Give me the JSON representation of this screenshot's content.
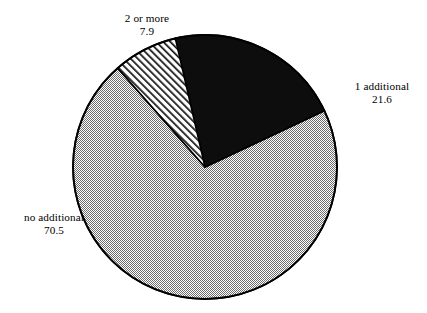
{
  "figure": {
    "background_color": "#ffffff",
    "width": 427,
    "height": 313
  },
  "chart_data": {
    "type": "pie",
    "title": "",
    "subtitle": "",
    "xlabel": "",
    "ylabel": "",
    "legend_position": "none",
    "grid": false,
    "units": "percent",
    "total": 100.0,
    "start_angle_deg_from_12oclock": -13,
    "direction": "clockwise",
    "categories": [
      "1 additional",
      "no additional",
      "2 or more"
    ],
    "values": [
      21.6,
      70.5,
      7.9
    ],
    "labels": [
      {
        "name": "1 additional",
        "value": "21.6",
        "value_number": 21.6,
        "fill": "black-solid",
        "color": "#0a0a0a",
        "position": "right"
      },
      {
        "name": "no additional",
        "value": "70.5",
        "value_number": 70.5,
        "fill": "gray-dither",
        "color": "#b5b5b5",
        "position": "left"
      },
      {
        "name": "2 or more",
        "value": "7.9",
        "value_number": 7.9,
        "fill": "diagonal-hatch",
        "color": "#ffffff",
        "position": "top"
      }
    ],
    "slices": [
      {
        "label": "1 additional",
        "percent": 21.6,
        "sweep_deg": 77.76,
        "start_deg": -13.0,
        "end_deg": 64.76
      },
      {
        "label": "no additional",
        "percent": 70.5,
        "sweep_deg": 253.8,
        "start_deg": 64.76,
        "end_deg": 318.56
      },
      {
        "label": "2 or more",
        "percent": 7.9,
        "sweep_deg": 28.44,
        "start_deg": 318.56,
        "end_deg": 347.0
      }
    ],
    "geometry": {
      "center_x": 205,
      "center_y": 167,
      "radius": 132,
      "outline_color": "#000000",
      "outline_width": 1.6
    }
  },
  "labels_text": {
    "two_or_more": {
      "name": "2 or more",
      "value": "7.9"
    },
    "one_additional": {
      "name": "1 additional",
      "value": "21.6"
    },
    "no_additional": {
      "name": "no additional",
      "value": "70.5"
    }
  }
}
